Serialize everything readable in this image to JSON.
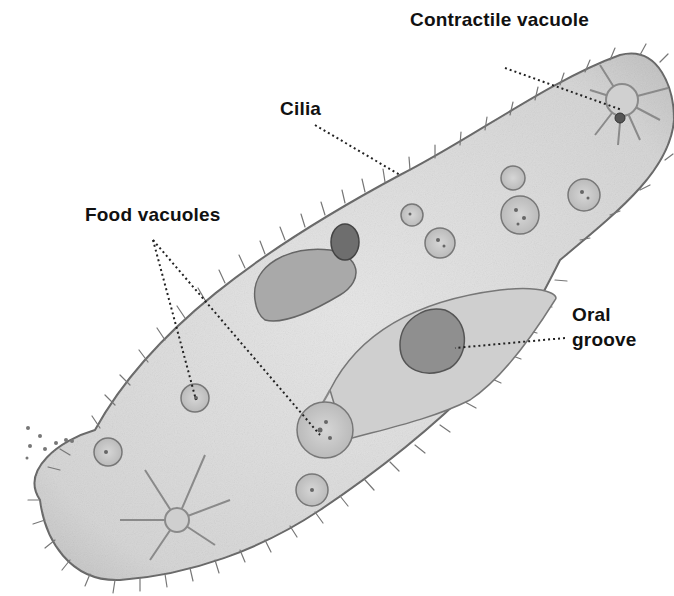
{
  "diagram": {
    "style": "grayscale pencil illustration",
    "colors": {
      "background": "#ffffff",
      "body_fill": "#d9d9d9",
      "outline": "#555555",
      "label_text": "#111111",
      "leader": "#222222"
    },
    "labels": [
      {
        "id": "contractile-vacuole",
        "text": "Contractile vacuole",
        "x": 410,
        "y": 8,
        "leader": {
          "from": [
            505,
            68
          ],
          "to": [
            622,
            110
          ]
        }
      },
      {
        "id": "cilia",
        "text": "Cilia",
        "x": 280,
        "y": 97,
        "leader": {
          "from": [
            315,
            125
          ],
          "to": [
            400,
            175
          ]
        }
      },
      {
        "id": "food-vacuoles",
        "text": "Food vacuoles",
        "x": 85,
        "y": 203,
        "leaders": [
          {
            "from": [
              153,
              240
            ],
            "to": [
              196,
              400
            ]
          },
          {
            "from": [
              153,
              240
            ],
            "to": [
              320,
              435
            ]
          }
        ]
      },
      {
        "id": "oral-groove",
        "text_line1": "Oral",
        "text_line2": "groove",
        "x": 572,
        "y": 303,
        "leader": {
          "from": [
            565,
            338
          ],
          "to": [
            455,
            348
          ]
        }
      }
    ]
  }
}
